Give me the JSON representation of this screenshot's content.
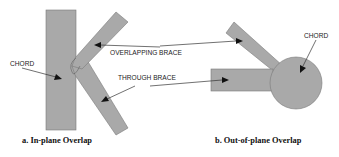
{
  "diagram": {
    "colors": {
      "member_fill": "#a9a9a9",
      "member_stroke": "#7a7a7a",
      "leader": "#333333",
      "background": "#ffffff"
    },
    "panel_a": {
      "caption": "a. In-plane Overlap",
      "labels": {
        "chord": "CHORD",
        "overlapping_brace": "OVERLAPPING BRACE",
        "through_brace": "THROUGH BRACE"
      },
      "members": [
        "chord (vertical rectangle)",
        "overlapping brace (upper diagonal)",
        "through brace (lower diagonal)"
      ]
    },
    "panel_b": {
      "caption": "b. Out-of-plane Overlap",
      "labels": {
        "chord": "CHORD"
      },
      "members": [
        "chord (circular cross-section)",
        "overlapping brace (diagonal)",
        "through brace (horizontal)"
      ]
    }
  }
}
